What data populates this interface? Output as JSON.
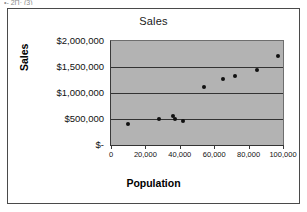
{
  "clipped_header_text": "•-  2Π·  (3)",
  "chart_data": {
    "type": "scatter",
    "title": "Sales",
    "xlabel": "Population",
    "ylabel": "Sales",
    "xlim": [
      0,
      100000
    ],
    "ylim": [
      0,
      2000000
    ],
    "grid": true,
    "legend": false,
    "plot_background": "#b3b3b3",
    "marker_color": "#111111",
    "xticks": [
      0,
      20000,
      40000,
      60000,
      80000,
      100000
    ],
    "xtick_labels": [
      "0",
      "20,000",
      "40,000",
      "60,000",
      "80,000",
      "100,000"
    ],
    "yticks": [
      0,
      500000,
      1000000,
      1500000,
      2000000
    ],
    "ytick_labels": [
      "$-",
      "$500,000",
      "$1,000,000",
      "$1,500,000",
      "$2,000,000"
    ],
    "series": [
      {
        "name": "Sales",
        "points": [
          {
            "x": 10000,
            "y": 400000
          },
          {
            "x": 28000,
            "y": 500000
          },
          {
            "x": 36000,
            "y": 565000
          },
          {
            "x": 37000,
            "y": 495000
          },
          {
            "x": 42000,
            "y": 470000
          },
          {
            "x": 54000,
            "y": 1120000
          },
          {
            "x": 65000,
            "y": 1265000
          },
          {
            "x": 72000,
            "y": 1320000
          },
          {
            "x": 85000,
            "y": 1450000
          },
          {
            "x": 97000,
            "y": 1720000
          }
        ]
      }
    ]
  }
}
